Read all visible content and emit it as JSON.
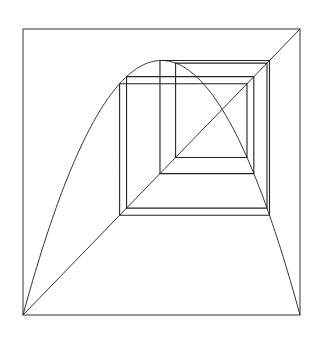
{
  "diagram": {
    "type": "cobweb",
    "map": "logistic",
    "frame": {
      "x0": 23,
      "y0": 29,
      "x1": 300,
      "y1": 315
    },
    "parameters": {
      "r": 3.56,
      "x_start": 0.5,
      "transient": 300,
      "iterations": 64
    },
    "domain": [
      0,
      1
    ],
    "range": [
      0,
      1
    ],
    "colors": {
      "frame": "#444444",
      "curve": "#333333",
      "diagonal": "#333333",
      "cobweb": "#222222",
      "background": "#ffffff"
    },
    "elements": [
      "square frame",
      "identity diagonal y=x",
      "parabola y=r·x·(1-x)",
      "cobweb orbit"
    ]
  }
}
